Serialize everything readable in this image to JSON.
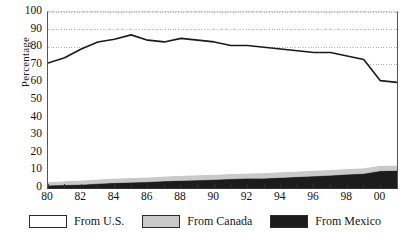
{
  "chart_data": {
    "type": "area",
    "stacked": true,
    "title": "",
    "subtitle": "",
    "xlabel": "",
    "ylabel": "Percentage",
    "ylim": [
      0,
      100
    ],
    "xlim": [
      1980,
      2001
    ],
    "grid": true,
    "grid_style": "dotted-horizontal",
    "legend_position": "bottom",
    "x": [
      1980,
      1981,
      1982,
      1983,
      1984,
      1985,
      1986,
      1987,
      1988,
      1989,
      1990,
      1991,
      1992,
      1993,
      1994,
      1995,
      1996,
      1997,
      1998,
      1999,
      2000,
      2001
    ],
    "xtick_labels": [
      "80",
      "",
      "82",
      "",
      "84",
      "",
      "86",
      "",
      "88",
      "",
      "90",
      "",
      "92",
      "",
      "94",
      "",
      "96",
      "",
      "98",
      "",
      "00",
      ""
    ],
    "xtick_labels_shown": [
      "80",
      "82",
      "84",
      "86",
      "88",
      "90",
      "92",
      "94",
      "96",
      "98",
      "00"
    ],
    "ytick_labels": [
      "0",
      "10",
      "20",
      "30",
      "40",
      "50",
      "60",
      "70",
      "80",
      "90",
      "100"
    ],
    "ytick_values": [
      0,
      10,
      20,
      30,
      40,
      50,
      60,
      70,
      80,
      90,
      100
    ],
    "series": [
      {
        "name": "From Mexico",
        "color": "#1c1c1c",
        "stack_order": 1,
        "values": [
          1.5,
          1.8,
          2.0,
          2.5,
          3.0,
          3.2,
          3.5,
          4.0,
          4.3,
          4.5,
          4.8,
          5.2,
          5.5,
          5.6,
          6.0,
          6.4,
          6.8,
          7.2,
          7.8,
          8.2,
          9.8,
          10.0
        ]
      },
      {
        "name": "From Canada",
        "color": "#c9c9c9",
        "stack_order": 2,
        "values": [
          1.8,
          2.0,
          2.2,
          2.3,
          2.4,
          2.5,
          2.5,
          2.6,
          2.6,
          2.7,
          2.7,
          2.8,
          2.8,
          2.9,
          2.9,
          3.0,
          3.0,
          3.0,
          3.0,
          3.0,
          2.8,
          2.8
        ]
      },
      {
        "name": "From U.S.",
        "color": "#ffffff",
        "stack_order": 3,
        "values": [
          67.7,
          70.2,
          74.8,
          78.2,
          79.1,
          81.3,
          78.0,
          76.4,
          78.1,
          76.8,
          75.5,
          73.0,
          72.7,
          71.5,
          70.1,
          68.6,
          67.2,
          66.8,
          64.2,
          61.8,
          48.4,
          47.2
        ]
      }
    ],
    "total_line": {
      "name": "Top of stack (total)",
      "color": "#1a1a1a",
      "values": [
        71,
        74,
        79,
        83,
        84.5,
        87,
        84,
        83,
        85,
        84,
        83,
        81,
        81,
        80,
        79,
        78,
        77,
        77,
        75,
        73,
        61,
        60
      ]
    }
  },
  "axis": {
    "ylabel": "Percentage"
  },
  "legend": {
    "items": [
      {
        "label": "From U.S.",
        "swatch": "#ffffff"
      },
      {
        "label": "From Canada",
        "swatch": "#c9c9c9"
      },
      {
        "label": "From Mexico",
        "swatch": "#1c1c1c"
      }
    ]
  }
}
